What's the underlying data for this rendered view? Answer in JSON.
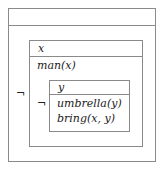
{
  "diagram": {
    "type": "DRS",
    "outer": {
      "referents": "",
      "conditions_operator": "¬"
    },
    "middle": {
      "referents": "x",
      "conditions": [
        "man(x)"
      ],
      "nested_operator": "¬"
    },
    "inner": {
      "referents": "y",
      "conditions": [
        "umbrella(y)",
        "bring(x, y)"
      ]
    },
    "colors": {
      "border": "#8a8a8a",
      "text": "#222222"
    }
  }
}
